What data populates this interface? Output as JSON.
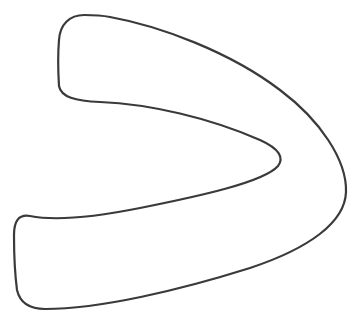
{
  "figure": {
    "shape_name": "chevron-right-outline",
    "stroke_color": "#3a3a3a",
    "fill_color": "#ffffff",
    "background_color": "#ffffff",
    "stroke_width": 2.2
  }
}
